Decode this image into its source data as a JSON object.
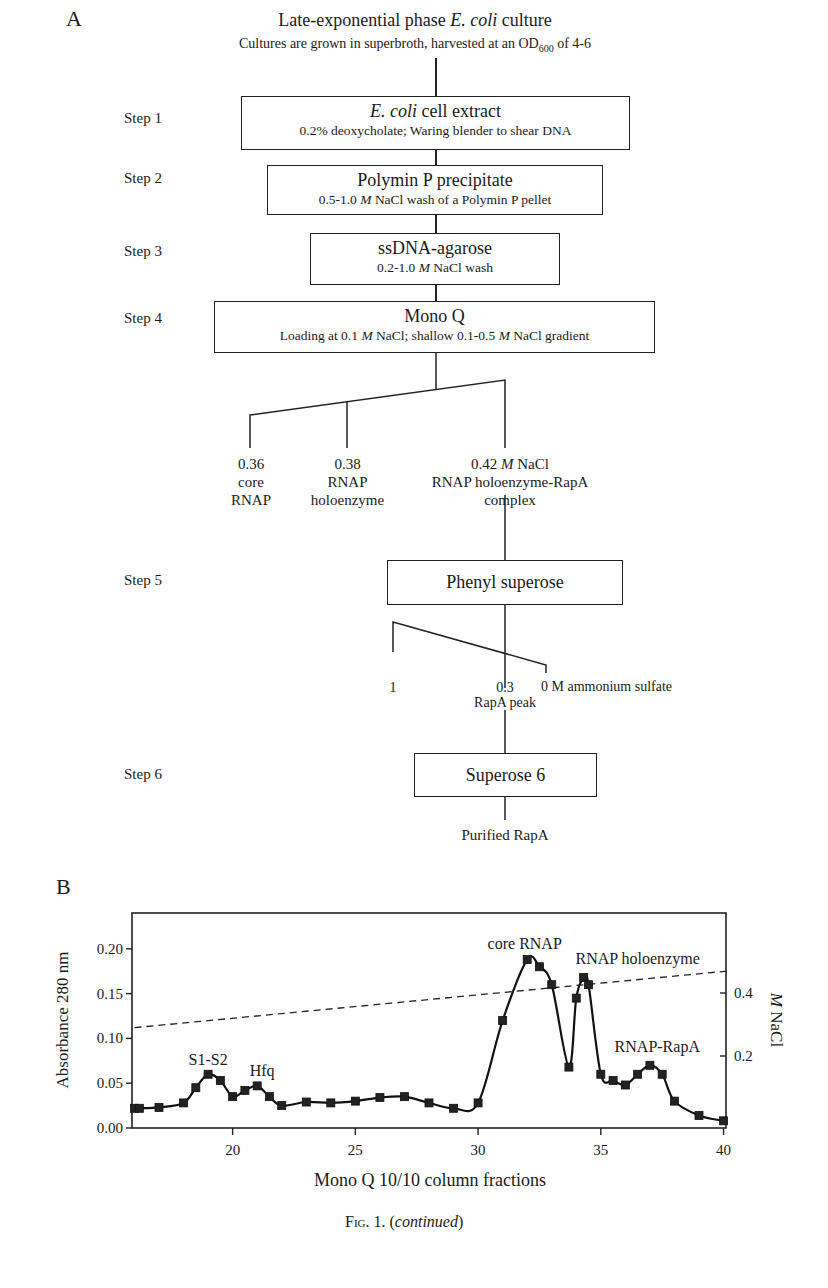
{
  "panel_a": {
    "letter": "A",
    "title_prefix": "Late-exponential phase ",
    "title_italic": "E. coli",
    "title_suffix": " culture",
    "subtitle_prefix": "Cultures are grown in superbroth, harvested at an OD",
    "subtitle_sub": "600",
    "subtitle_suffix": " of 4-6",
    "steps": [
      {
        "label": "Step 1",
        "title_italic": "E. coli",
        "title_rest": " cell extract",
        "detail": "0.2% deoxycholate; Waring blender to shear DNA"
      },
      {
        "label": "Step 2",
        "title": "Polymin P precipitate",
        "detail_a": "0.5-1.0 ",
        "detail_m": "M",
        "detail_b": " NaCl wash of a Polymin P pellet"
      },
      {
        "label": "Step 3",
        "title": "ssDNA-agarose",
        "detail_a": "0.2-1.0 ",
        "detail_m": "M",
        "detail_b": " NaCl wash"
      },
      {
        "label": "Step 4",
        "title": "Mono Q",
        "detail_a": "Loading at 0.1 ",
        "detail_m": "M",
        "detail_b": " NaCl; shallow 0.1-0.5 ",
        "detail_m2": "M",
        "detail_c": " NaCl gradient"
      },
      {
        "label": "Step 5",
        "title": "Phenyl superose"
      },
      {
        "label": "Step 6",
        "title": "Superose 6"
      }
    ],
    "monoq_branches": [
      {
        "value": "0.36",
        "line2": "core",
        "line3": "RNAP"
      },
      {
        "value": "0.38",
        "line2": "RNAP",
        "line3": "holoenzyme"
      },
      {
        "value_a": "0.42 ",
        "value_m": "M",
        "value_b": " NaCl",
        "line2": "RNAP holoenzyme-RapA",
        "line3": "complex"
      }
    ],
    "phenyl_branches": {
      "left": "1",
      "mid": "0.3",
      "right": "0 M ammonium sulfate",
      "peak": "RapA peak"
    },
    "final": "Purified RapA"
  },
  "panel_b": {
    "letter": "B"
  },
  "caption": {
    "fig": "Fig. 1.",
    "open": " (",
    "italic": "continued",
    "close": ")"
  },
  "chart_data": {
    "type": "line",
    "title": "",
    "xlabel": "Mono Q 10/10 column fractions",
    "ylabel": "Absorbance 280 nm",
    "y2label": "M NaCl",
    "xlim": [
      16,
      40.2
    ],
    "ylim": [
      0,
      0.24
    ],
    "y2lim": [
      0,
      0.5
    ],
    "xticks": [
      20,
      25,
      30,
      35,
      40
    ],
    "yticks": [
      "0.00",
      "0.05",
      "0.10",
      "0.15",
      "0.20"
    ],
    "y2ticks": [
      "0.2",
      "0.4"
    ],
    "grid": false,
    "series": [
      {
        "name": "A280",
        "style": "solid-with-square-markers",
        "x": [
          16,
          16.2,
          17,
          18,
          18.5,
          19,
          19.5,
          20,
          20.5,
          21,
          21.5,
          22,
          23,
          24,
          25,
          26,
          27,
          28,
          29,
          30,
          31,
          32,
          32.5,
          33,
          33.7,
          34,
          34.3,
          34.5,
          35,
          35.5,
          36,
          36.5,
          37,
          37.5,
          38,
          39,
          40
        ],
        "values": [
          0.022,
          0.022,
          0.023,
          0.028,
          0.045,
          0.06,
          0.053,
          0.035,
          0.042,
          0.047,
          0.035,
          0.025,
          0.029,
          0.028,
          0.03,
          0.034,
          0.035,
          0.028,
          0.022,
          0.028,
          0.12,
          0.188,
          0.18,
          0.16,
          0.068,
          0.145,
          0.168,
          0.16,
          0.06,
          0.053,
          0.048,
          0.06,
          0.07,
          0.06,
          0.03,
          0.014,
          0.008
        ]
      },
      {
        "name": "NaCl gradient",
        "axis": "right",
        "style": "dashed",
        "x": [
          16,
          40.2
        ],
        "values": [
          0.29,
          0.47
        ]
      }
    ],
    "annotations": [
      {
        "text": "S1-S2",
        "x": 19,
        "y": 0.07
      },
      {
        "text": "Hfq",
        "x": 21.2,
        "y": 0.058
      },
      {
        "text": "core RNAP",
        "x": 31.9,
        "y": 0.2
      },
      {
        "text": "RNAP holoenzyme",
        "x": 36.5,
        "y": 0.183
      },
      {
        "text": "RNAP-RapA",
        "x": 37.3,
        "y": 0.085
      }
    ]
  }
}
